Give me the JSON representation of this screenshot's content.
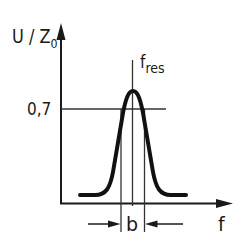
{
  "diagram": {
    "type": "resonance-curve",
    "y_axis": {
      "label_main": "U / Z",
      "label_sub": "0"
    },
    "x_axis": {
      "label": "f"
    },
    "level_marker": {
      "label": "0,7"
    },
    "resonance": {
      "label_main": "f",
      "label_sub": "res"
    },
    "bandwidth": {
      "label": "b"
    },
    "colors": {
      "line": "#1a1a1a",
      "background": "#ffffff"
    }
  }
}
